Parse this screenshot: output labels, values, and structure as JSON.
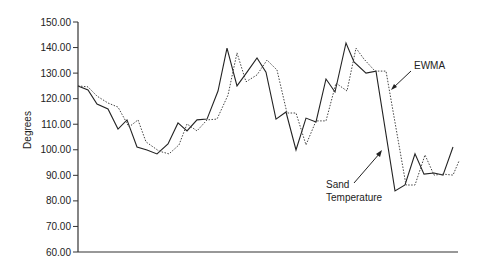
{
  "chart_data": {
    "type": "line",
    "title": "",
    "xlabel": "",
    "ylabel": "Degrees",
    "ylim": [
      60,
      150
    ],
    "yticks": [
      "150.00",
      "140.00",
      "130.00",
      "120.00",
      "110.00",
      "100.00",
      "90.00",
      "80.00",
      "70.00",
      "60.00"
    ],
    "grid": false,
    "legend": "none (inline annotations with arrows)",
    "annotations": [
      {
        "text": "EWMA",
        "target_series": "EWMA"
      },
      {
        "text": "Sand\nTemperature",
        "target_series": "Sand Temperature"
      }
    ],
    "series": [
      {
        "name": "Sand Temperature",
        "style": "solid",
        "values": [
          125.0,
          123.4,
          117.9,
          116.0,
          108.1,
          111.7,
          101.1,
          99.9,
          98.4,
          102.3,
          110.5,
          107.4,
          111.7,
          112.0,
          123.0,
          139.8,
          125.0,
          130.4,
          135.9,
          130.4,
          112.0,
          114.8,
          99.9,
          112.4,
          110.9,
          127.7,
          122.6,
          141.8,
          134.4,
          130.0,
          130.8,
          83.9,
          86.2,
          98.4,
          90.5,
          90.9,
          90.1,
          101.1
        ]
      },
      {
        "name": "EWMA",
        "style": "dotted",
        "values": [
          125.0,
          124.6,
          121.0,
          118.3,
          116.7,
          108.9,
          111.7,
          103.1,
          99.5,
          98.4,
          101.9,
          110.1,
          107.4,
          111.7,
          112.0,
          121.4,
          137.9,
          126.6,
          129.3,
          135.1,
          131.2,
          114.4,
          114.4,
          101.9,
          111.3,
          111.3,
          126.1,
          123.0,
          139.8,
          135.5,
          130.8,
          130.8,
          86.2,
          86.2,
          98.0,
          90.1,
          90.5,
          90.1,
          95.6
        ]
      }
    ]
  },
  "labels": {
    "y_axis": "Degrees",
    "ewma": "EWMA",
    "sand_line1": "Sand",
    "sand_line2": "Temperature"
  }
}
